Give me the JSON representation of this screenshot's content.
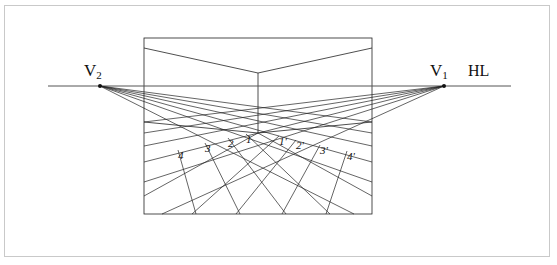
{
  "figure": {
    "background_color": "#ffffff",
    "frame_color": "#c9c9c9",
    "line_color": "#222222"
  },
  "horizon": {
    "label": "HL",
    "label_x": 468,
    "label_y": 63,
    "line_x1": 48,
    "line_x2": 511,
    "line_y": 86
  },
  "vanishing_points": {
    "left": {
      "label_main": "V",
      "label_sub": "2",
      "label_x": 84,
      "label_y": 62,
      "x": 100,
      "y": 86
    },
    "right": {
      "label_main": "V",
      "label_sub": "1",
      "label_x": 430,
      "label_y": 62,
      "x": 444,
      "y": 86
    }
  },
  "picture_plane": {
    "x": 144,
    "y": 38,
    "width": 228,
    "height": 176
  },
  "room": {
    "ceiling_apex_x": 258,
    "ceiling_apex_y": 73,
    "ceiling_left_x": 144,
    "ceiling_left_y": 48,
    "ceiling_right_x": 372,
    "ceiling_right_y": 48,
    "corner_bottom_x": 258,
    "corner_bottom_y": 133,
    "floor_left_x": 144,
    "floor_left_y": 122,
    "floor_right_x": 372,
    "floor_right_y": 122
  },
  "grid_labels_left": [
    {
      "text": "1",
      "x": 246,
      "y": 134
    },
    {
      "text": "2",
      "x": 228,
      "y": 138
    },
    {
      "text": "3",
      "x": 205,
      "y": 143
    },
    {
      "text": "4",
      "x": 178,
      "y": 150
    }
  ],
  "grid_labels_right": [
    {
      "text": "1'",
      "x": 279,
      "y": 136
    },
    {
      "text": "2'",
      "x": 296,
      "y": 140
    },
    {
      "text": "3'",
      "x": 320,
      "y": 145
    },
    {
      "text": "4'",
      "x": 347,
      "y": 151
    }
  ],
  "chart_data": {
    "type": "diagram",
    "annotations": [
      "V2",
      "V1",
      "HL",
      "1",
      "2",
      "3",
      "4",
      "1'",
      "2'",
      "3'",
      "4'"
    ],
    "vanishing_point_left": [
      100,
      86
    ],
    "vanishing_point_right": [
      444,
      86
    ],
    "horizon_y": 86,
    "grid_divisions": 4
  }
}
